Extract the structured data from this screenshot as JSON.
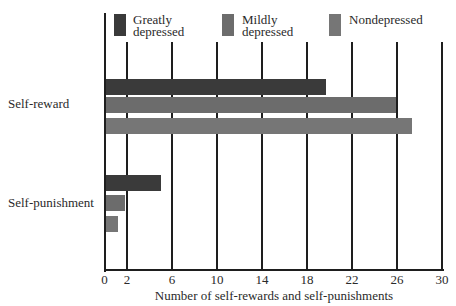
{
  "chart_data": {
    "type": "bar",
    "orientation": "horizontal",
    "title": "",
    "xlabel": "Number of self-rewards and self-punishments",
    "ylabel": "",
    "xlim": [
      0,
      30
    ],
    "x_ticks": [
      0,
      2,
      6,
      10,
      14,
      18,
      22,
      26,
      30
    ],
    "grid": true,
    "legend_position": "top",
    "categories": [
      "Self-reward",
      "Self-punishment"
    ],
    "series": [
      {
        "name": "Greatly depressed",
        "color": "#3a3a3a",
        "values": [
          19.7,
          5.0
        ]
      },
      {
        "name": "Mildly depressed",
        "color": "#6c6c6c",
        "values": [
          25.9,
          1.8
        ]
      },
      {
        "name": "Nondepressed",
        "color": "#767676",
        "values": [
          27.3,
          1.2
        ]
      }
    ]
  },
  "legend": [
    {
      "label": "Greatly\ndepressed",
      "color": "#3a3a3a"
    },
    {
      "label": "Mildly\ndepressed",
      "color": "#6c6c6c"
    },
    {
      "label": "Nondepressed",
      "color": "#767676"
    }
  ],
  "tick_labels": [
    "0",
    "2",
    "6",
    "10",
    "14",
    "18",
    "22",
    "26",
    "30"
  ],
  "category_labels": [
    "Self-reward",
    "Self-punishment"
  ],
  "xlabel": "Number of self-rewards and self-punishments"
}
